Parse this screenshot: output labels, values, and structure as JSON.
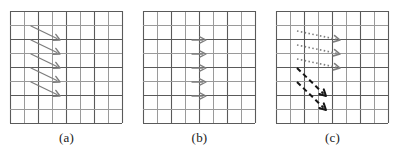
{
  "figure": {
    "width": 401,
    "height": 159,
    "background": "#ffffff",
    "grid": {
      "cols": 8,
      "rows": 8,
      "cell_size": 14,
      "origin_x": 2,
      "origin_y": 2,
      "line_color_major": "#5a5a5a",
      "line_color_minor": "#9a9a9a",
      "line_width_major": 1.1,
      "line_width_minor": 1.0
    },
    "colors": {
      "arrow_gray": "#7d7d7d",
      "arrow_black": "#141414",
      "caption": "#1a1a1a"
    },
    "panels": [
      {
        "id": "panel-a",
        "caption": "(a)",
        "arrow_groups": [
          {
            "name": "diagonal-gray-solid",
            "style": "solid",
            "color": "#7d7d7d",
            "width": 1.3,
            "arrows": [
              {
                "x1": 23,
                "y1": 17,
                "x2": 52,
                "y2": 31
              },
              {
                "x1": 23,
                "y1": 31,
                "x2": 52,
                "y2": 45
              },
              {
                "x1": 23,
                "y1": 45,
                "x2": 52,
                "y2": 59
              },
              {
                "x1": 23,
                "y1": 59,
                "x2": 52,
                "y2": 73
              },
              {
                "x1": 23,
                "y1": 73,
                "x2": 52,
                "y2": 87
              }
            ]
          }
        ]
      },
      {
        "id": "panel-b",
        "caption": "(b)",
        "arrow_groups": [
          {
            "name": "horizontal-gray-solid",
            "style": "solid",
            "color": "#7d7d7d",
            "width": 1.3,
            "arrows": [
              {
                "x1": 51,
                "y1": 31,
                "x2": 65,
                "y2": 31
              },
              {
                "x1": 51,
                "y1": 45,
                "x2": 65,
                "y2": 45
              },
              {
                "x1": 51,
                "y1": 59,
                "x2": 65,
                "y2": 59
              },
              {
                "x1": 51,
                "y1": 73,
                "x2": 65,
                "y2": 73
              },
              {
                "x1": 51,
                "y1": 87,
                "x2": 65,
                "y2": 87
              }
            ]
          }
        ]
      },
      {
        "id": "panel-c",
        "caption": "(c)",
        "arrow_groups": [
          {
            "name": "shallow-gray-dotted",
            "style": "dotted",
            "color": "#7d7d7d",
            "width": 1.6,
            "dasharray": "1.5 2.4",
            "arrows": [
              {
                "x1": 23,
                "y1": 22,
                "x2": 66,
                "y2": 31
              },
              {
                "x1": 23,
                "y1": 36,
                "x2": 66,
                "y2": 45
              },
              {
                "x1": 23,
                "y1": 50,
                "x2": 66,
                "y2": 59
              }
            ]
          },
          {
            "name": "steep-black-dashed",
            "style": "dashed",
            "color": "#141414",
            "width": 2.0,
            "dasharray": "5 3.5",
            "arrows": [
              {
                "x1": 23,
                "y1": 59,
                "x2": 52,
                "y2": 87
              },
              {
                "x1": 23,
                "y1": 73,
                "x2": 52,
                "y2": 101
              }
            ]
          }
        ]
      }
    ]
  }
}
